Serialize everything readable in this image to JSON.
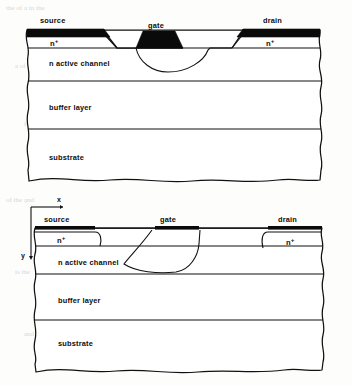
{
  "figure": {
    "ink_color": "#111111",
    "electrode_color": "#0a0a0a",
    "background_color": "#fdfdfc",
    "diagrams": [
      {
        "id": "upper",
        "style": "recessed-gate",
        "terminals": [
          {
            "name": "source",
            "label": "source"
          },
          {
            "name": "gate",
            "label": "gate"
          },
          {
            "name": "drain",
            "label": "drain"
          }
        ],
        "doped_regions": [
          {
            "name": "source-nplus",
            "base": "n",
            "superscript": "+"
          },
          {
            "name": "drain-nplus",
            "base": "n",
            "superscript": "+"
          }
        ],
        "layers": [
          {
            "name": "active-channel",
            "label": "n  active  channel"
          },
          {
            "name": "buffer-layer",
            "label": "buffer  layer"
          },
          {
            "name": "substrate",
            "label": "substrate"
          }
        ]
      },
      {
        "id": "lower",
        "style": "planar-gate",
        "axes": [
          {
            "name": "x-axis",
            "label": "x",
            "direction": "right"
          },
          {
            "name": "y-axis",
            "label": "y",
            "direction": "down"
          }
        ],
        "terminals": [
          {
            "name": "source",
            "label": "source"
          },
          {
            "name": "gate",
            "label": "gate"
          },
          {
            "name": "drain",
            "label": "drain"
          }
        ],
        "doped_regions": [
          {
            "name": "source-nplus",
            "base": "n",
            "superscript": "+"
          },
          {
            "name": "drain-nplus",
            "base": "n",
            "superscript": "+"
          }
        ],
        "layers": [
          {
            "name": "active-channel",
            "label": "n  active  channel"
          },
          {
            "name": "buffer-layer",
            "label": "buffer  layer"
          },
          {
            "name": "substrate",
            "label": "substrate"
          }
        ]
      }
    ]
  },
  "scan_artifacts": {
    "visible": true,
    "rows": [
      "the    of    a          in    the",
      "a            of    the",
      "for  a                 in",
      "of  the          and",
      "is            the",
      "and    the        of"
    ]
  }
}
